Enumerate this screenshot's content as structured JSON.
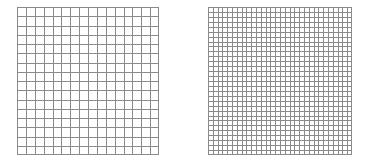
{
  "figure": {
    "panels": [
      {
        "name": "coarse-grid",
        "columns": 16,
        "rows": 16,
        "line_color": "#8a8a8a"
      },
      {
        "name": "fine-grid",
        "columns": 30,
        "rows": 30,
        "line_color": "#8a8a8a"
      }
    ],
    "background": "#ffffff"
  }
}
